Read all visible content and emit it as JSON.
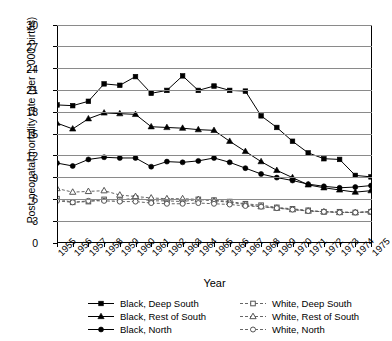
{
  "chart_data": {
    "type": "line",
    "title": "",
    "xlabel": "Year",
    "ylabel": "Post-neonatal mortality rate (per 1,000 births)",
    "x": [
      1955,
      1956,
      1957,
      1958,
      1959,
      1960,
      1961,
      1962,
      1963,
      1964,
      1965,
      1966,
      1967,
      1968,
      1969,
      1970,
      1971,
      1972,
      1973,
      1974,
      1975
    ],
    "xtick_labels": [
      "1955",
      "1956",
      "1957",
      "1958",
      "1959",
      "1960",
      "1961",
      "1962",
      "1963",
      "1964",
      "1965",
      "1966",
      "1967",
      "1968",
      "1969",
      "1970",
      "1971",
      "1972",
      "1973",
      "1974",
      "1975"
    ],
    "ylim": [
      0,
      30
    ],
    "ytick_labels": [
      "0",
      "3",
      "6",
      "9",
      "12",
      "15",
      "18",
      "21",
      "24",
      "27",
      "30"
    ],
    "yticks": [
      0,
      3,
      6,
      9,
      12,
      15,
      18,
      21,
      24,
      27,
      30
    ],
    "grid": true,
    "legend_position": "below",
    "series": [
      {
        "name": "Black, Deep South",
        "marker": "filled-square",
        "linestyle": "solid",
        "color": "#000000",
        "values": [
          19.0,
          18.9,
          19.5,
          21.9,
          21.7,
          22.9,
          20.6,
          21.0,
          23.0,
          21.0,
          21.6,
          21.0,
          20.9,
          17.5,
          15.9,
          14.0,
          12.4,
          11.6,
          11.5,
          9.3,
          9.1
        ]
      },
      {
        "name": "Black, Rest of South",
        "marker": "filled-triangle",
        "linestyle": "solid",
        "color": "#000000",
        "values": [
          16.5,
          15.7,
          17.1,
          17.9,
          17.8,
          17.7,
          16.0,
          15.9,
          15.8,
          15.6,
          15.5,
          14.0,
          12.6,
          11.2,
          10.0,
          9.0,
          8.0,
          7.6,
          7.3,
          7.0,
          7.2
        ]
      },
      {
        "name": "Black, North",
        "marker": "filled-circle",
        "linestyle": "solid",
        "color": "#000000",
        "values": [
          11.0,
          10.6,
          11.5,
          11.8,
          11.7,
          11.7,
          10.5,
          11.2,
          11.1,
          11.3,
          11.7,
          11.1,
          10.3,
          9.5,
          9.0,
          8.6,
          8.1,
          7.8,
          7.6,
          7.7,
          7.9
        ]
      },
      {
        "name": "White, Deep South",
        "marker": "open-square",
        "linestyle": "dashed",
        "color": "#555555",
        "values": [
          6.1,
          5.6,
          5.7,
          6.0,
          5.9,
          6.2,
          5.8,
          5.8,
          5.7,
          6.0,
          5.9,
          5.7,
          5.4,
          5.2,
          4.9,
          4.7,
          4.5,
          4.3,
          4.3,
          4.2,
          4.3
        ]
      },
      {
        "name": "White, Rest of South",
        "marker": "open-triangle",
        "linestyle": "dashed",
        "color": "#555555",
        "values": [
          7.5,
          7.0,
          7.1,
          7.2,
          6.6,
          6.4,
          6.2,
          6.1,
          6.1,
          6.0,
          5.8,
          5.6,
          5.3,
          5.0,
          4.8,
          4.6,
          4.4,
          4.3,
          4.2,
          4.2,
          4.3
        ]
      },
      {
        "name": "White, North",
        "marker": "open-circle",
        "linestyle": "dashed",
        "color": "#555555",
        "values": [
          5.8,
          5.6,
          5.8,
          5.8,
          5.7,
          5.7,
          5.5,
          5.4,
          5.4,
          5.5,
          5.4,
          5.3,
          5.1,
          5.0,
          4.8,
          4.6,
          4.4,
          4.3,
          4.2,
          4.2,
          4.3
        ]
      }
    ]
  }
}
